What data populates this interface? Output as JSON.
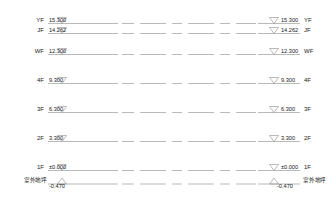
{
  "drawing": {
    "type": "architectural-elevation-levels",
    "units": "meters",
    "ground_line_label_left": "室外地坪",
    "ground_line_label_right": "室外地坪",
    "line_color": "#8c8c8c",
    "text_color": "#1a1a1a",
    "background": "#ffffff"
  },
  "levels": [
    {
      "id": "YF",
      "label_left": "YF",
      "label_right": "YF",
      "value": "15.300",
      "value_left": "15.300",
      "value_right": "15.300",
      "y": 23.5,
      "marker": "down-triangle"
    },
    {
      "id": "JF",
      "label_left": "JF",
      "label_right": "JF",
      "value": "14.262",
      "value_left": "14.262",
      "value_right": "14.262",
      "y": 33.5,
      "marker": "down-triangle"
    },
    {
      "id": "WF",
      "label_left": "WF",
      "label_right": "WF",
      "value": "12.300",
      "value_left": "12.300",
      "value_right": "12.300",
      "y": 54.5,
      "marker": "down-triangle"
    },
    {
      "id": "4F",
      "label_left": "4F",
      "label_right": "4F",
      "value": "9.300",
      "value_left": "9.300",
      "value_right": "9.300",
      "y": 83.5,
      "marker": "down-triangle"
    },
    {
      "id": "3F",
      "label_left": "3F",
      "label_right": "3F",
      "value": "6.300",
      "value_left": "6.300",
      "value_right": "6.300",
      "y": 112.5,
      "marker": "down-triangle"
    },
    {
      "id": "2F",
      "label_left": "2F",
      "label_right": "2F",
      "value": "3.300",
      "value_left": "3.300",
      "value_right": "3.300",
      "y": 141.5,
      "marker": "down-triangle"
    },
    {
      "id": "1F",
      "label_left": "1F",
      "label_right": "1F",
      "value": "±0.000",
      "value_left": "±0.000",
      "value_right": "±0.000",
      "y": 170.5,
      "marker": "down-triangle"
    },
    {
      "id": "GROUND",
      "label_left": "室外地坪",
      "label_right": "室外地坪",
      "value": "-0.470",
      "value_left": "-0.470",
      "value_right": "-0.470",
      "y": 184.0,
      "marker": "up-triangle"
    }
  ]
}
